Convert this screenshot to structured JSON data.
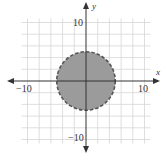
{
  "chart_data": {
    "type": "region",
    "title": "",
    "xlabel": "x",
    "ylabel": "y",
    "xlim": [
      -10,
      10
    ],
    "ylim": [
      -10,
      10
    ],
    "grid": true,
    "grid_step": 2,
    "tick_labels": {
      "x": [
        {
          "value": -10,
          "label": "−10"
        },
        {
          "value": 10,
          "label": "10"
        }
      ],
      "y": [
        {
          "value": 10,
          "label": "10"
        },
        {
          "value": -10,
          "label": "−10"
        }
      ]
    },
    "shapes": [
      {
        "kind": "circle",
        "center": [
          0,
          0
        ],
        "radius": 5,
        "boundary": "dashed",
        "fill": "shaded",
        "inequality": "x^2 + y^2 < 25"
      }
    ],
    "colors": {
      "fill": "#9b9b9b",
      "boundary": "#555555",
      "grid": "#d6d6d6",
      "axis": "#333333"
    }
  },
  "labels": {
    "x_axis": "x",
    "y_axis": "y",
    "x_neg": "−10",
    "x_pos": "10",
    "y_pos": "10",
    "y_neg": "−10"
  }
}
